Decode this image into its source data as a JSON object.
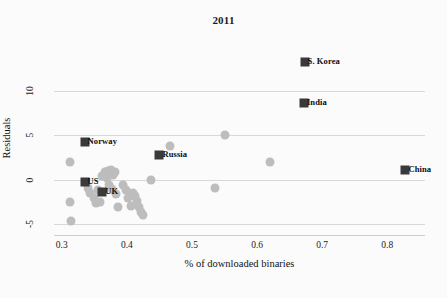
{
  "chart_data": {
    "type": "scatter",
    "title": "2011",
    "xlabel": "% of downloaded binaries",
    "ylabel": "Residuals",
    "xlim": [
      0.288,
      0.858
    ],
    "ylim": [
      -6.2,
      15.7
    ],
    "xticks": [
      0.3,
      0.4,
      0.5,
      0.6,
      0.7,
      0.8
    ],
    "xtick_labels": [
      "0.3",
      "0.4",
      "0.5",
      "0.6",
      "0.7",
      "0.8"
    ],
    "yticks": [
      10,
      5,
      0,
      -5
    ],
    "ytick_labels": [
      "10",
      "5",
      "0",
      "-5"
    ],
    "grid": "horizontal",
    "legend": "none",
    "colors": {
      "highlight_marker": "#3a3a3a",
      "plain_marker": "#bdbdbd",
      "gridline": "#d8d8d8",
      "text": "#111111",
      "background": "#fbfbfb"
    },
    "labeled_points": [
      {
        "name": "S. Korea",
        "x": 0.673,
        "y": 13.2,
        "label_side": "right"
      },
      {
        "name": "India",
        "x": 0.672,
        "y": 8.6,
        "label_side": "right"
      },
      {
        "name": "Norway",
        "x": 0.335,
        "y": 4.3,
        "label_side": "right"
      },
      {
        "name": "Russia",
        "x": 0.45,
        "y": 2.8,
        "label_side": "right"
      },
      {
        "name": "China",
        "x": 0.828,
        "y": 1.1,
        "label_side": "right"
      },
      {
        "name": "US",
        "x": 0.335,
        "y": -0.3,
        "label_side": "right"
      },
      {
        "name": "UK",
        "x": 0.362,
        "y": -1.4,
        "label_side": "right"
      }
    ],
    "unlabeled_points": [
      {
        "x": 0.55,
        "y": 5.0
      },
      {
        "x": 0.62,
        "y": 2.0
      },
      {
        "x": 0.535,
        "y": -0.9
      },
      {
        "x": 0.466,
        "y": 3.8
      },
      {
        "x": 0.437,
        "y": 0.0
      },
      {
        "x": 0.313,
        "y": 2.0
      },
      {
        "x": 0.312,
        "y": -2.5
      },
      {
        "x": 0.314,
        "y": -4.6
      },
      {
        "x": 0.344,
        "y": -1.5
      },
      {
        "x": 0.349,
        "y": -2.0
      },
      {
        "x": 0.352,
        "y": -2.6
      },
      {
        "x": 0.359,
        "y": -2.5
      },
      {
        "x": 0.362,
        "y": 0.4
      },
      {
        "x": 0.366,
        "y": 0.9
      },
      {
        "x": 0.369,
        "y": 0.2
      },
      {
        "x": 0.371,
        "y": 1.0
      },
      {
        "x": 0.374,
        "y": 0.6
      },
      {
        "x": 0.376,
        "y": 1.1
      },
      {
        "x": 0.378,
        "y": 0.5
      },
      {
        "x": 0.381,
        "y": 0.9
      },
      {
        "x": 0.372,
        "y": -0.6
      },
      {
        "x": 0.377,
        "y": -1.0
      },
      {
        "x": 0.384,
        "y": -1.6
      },
      {
        "x": 0.387,
        "y": -3.1
      },
      {
        "x": 0.394,
        "y": -0.6
      },
      {
        "x": 0.399,
        "y": -1.2
      },
      {
        "x": 0.402,
        "y": -2.1
      },
      {
        "x": 0.406,
        "y": -2.9
      },
      {
        "x": 0.41,
        "y": -1.5
      },
      {
        "x": 0.413,
        "y": -1.8
      },
      {
        "x": 0.416,
        "y": -2.4
      },
      {
        "x": 0.418,
        "y": -3.0
      },
      {
        "x": 0.421,
        "y": -3.6
      },
      {
        "x": 0.424,
        "y": -4.0
      },
      {
        "x": 0.356,
        "y": -1.1
      },
      {
        "x": 0.341,
        "y": -0.9
      }
    ]
  }
}
